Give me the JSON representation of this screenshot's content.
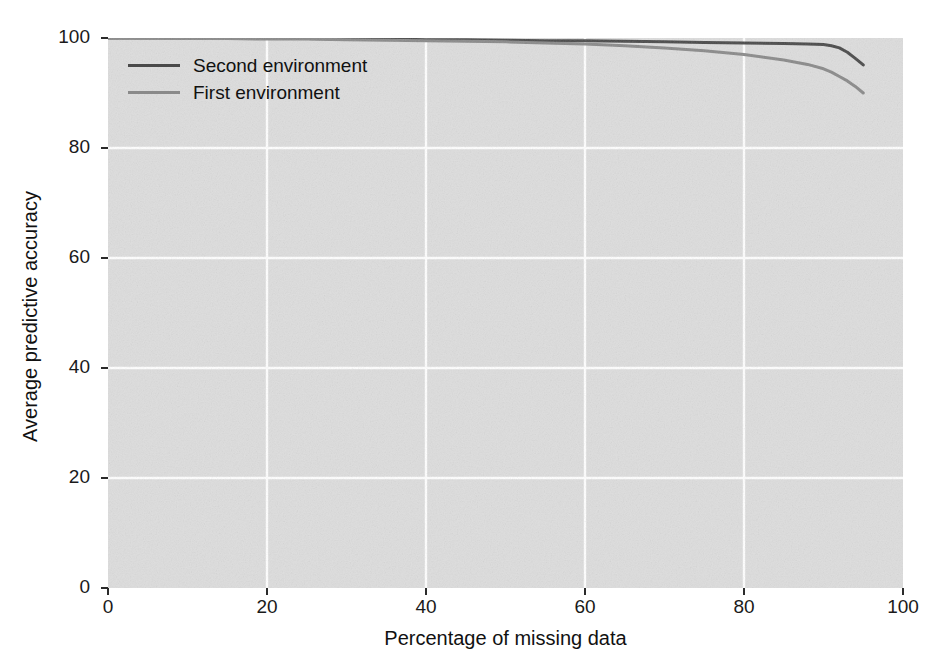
{
  "chart_data": {
    "type": "line",
    "title": "",
    "xlabel": "Percentage of missing data",
    "ylabel": "Average predictive accuracy",
    "xlim": [
      0,
      100
    ],
    "ylim": [
      0,
      100
    ],
    "xticks": [
      "0",
      "20",
      "40",
      "60",
      "80",
      "100"
    ],
    "yticks": [
      "0",
      "20",
      "40",
      "60",
      "80",
      "100"
    ],
    "xtick_values": [
      0,
      20,
      40,
      60,
      80,
      100
    ],
    "ytick_values": [
      0,
      20,
      40,
      60,
      80,
      100
    ],
    "grid": true,
    "grid_color": "#ffffff",
    "plot_background": "#dddddd",
    "figure_background": "#ffffff",
    "legend_position": "upper left",
    "series": [
      {
        "name": "Second environment",
        "color": "#4a4a4a",
        "linewidth": 3,
        "x": [
          0,
          5,
          10,
          15,
          20,
          25,
          30,
          35,
          40,
          45,
          50,
          55,
          60,
          65,
          70,
          75,
          80,
          85,
          88,
          90,
          91,
          92,
          93,
          94,
          95
        ],
        "y": [
          100,
          100,
          100,
          100,
          99.9,
          99.9,
          99.8,
          99.8,
          99.7,
          99.7,
          99.6,
          99.5,
          99.5,
          99.4,
          99.3,
          99.2,
          99.1,
          99.0,
          98.9,
          98.8,
          98.6,
          98.2,
          97.4,
          96.3,
          95.1
        ]
      },
      {
        "name": "First environment",
        "color": "#8a8a8a",
        "linewidth": 3,
        "x": [
          0,
          5,
          10,
          15,
          20,
          25,
          30,
          35,
          40,
          45,
          50,
          55,
          60,
          65,
          70,
          75,
          80,
          85,
          88,
          90,
          91,
          92,
          93,
          94,
          95
        ],
        "y": [
          100,
          100,
          99.9,
          99.9,
          99.8,
          99.8,
          99.7,
          99.6,
          99.5,
          99.4,
          99.3,
          99.1,
          98.9,
          98.6,
          98.2,
          97.7,
          97.0,
          96.0,
          95.2,
          94.4,
          93.8,
          93.0,
          92.2,
          91.2,
          90.0
        ]
      }
    ]
  },
  "legend": {
    "entries": [
      {
        "label": "Second environment"
      },
      {
        "label": "First environment"
      }
    ]
  }
}
